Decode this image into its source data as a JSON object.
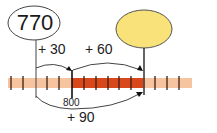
{
  "diagram": {
    "type": "number-line-jumps",
    "start_value": "770",
    "end_value": "",
    "tick_label": "800",
    "jumps": [
      {
        "label": "+ 30",
        "from": 770,
        "to": 800
      },
      {
        "label": "+ 60",
        "from": 800,
        "to": 860
      },
      {
        "label": "+ 90",
        "from": 770,
        "to": 860
      }
    ],
    "colors": {
      "line_light": "#f7c4a0",
      "line_dark": "#d9481c",
      "tick": "#3a1e10",
      "answer_oval_fill": "#f9e27a",
      "start_oval_fill": "#ffffff",
      "stroke": "#333333"
    }
  }
}
